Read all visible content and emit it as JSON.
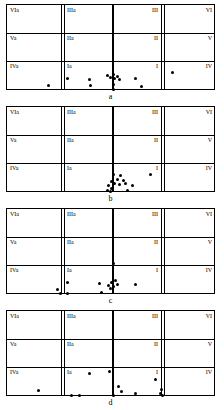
{
  "figure": {
    "title": "",
    "panel_letters": [
      "a",
      "b",
      "c",
      "d"
    ]
  },
  "grid": {
    "rows": 3,
    "columns": 4,
    "cell_labels": {
      "row_top": {
        "col1": "VIa",
        "col2": "IIIa",
        "col3": "III",
        "col4": "VI"
      },
      "row_middle": {
        "col1": "Va",
        "col2": "IIa",
        "col3": "II",
        "col4": "V"
      },
      "row_bottom": {
        "col1": "IVa",
        "col2": "Ia",
        "col3": "I",
        "col4": "IV"
      }
    }
  },
  "chart_data": {
    "type": "scatter",
    "title": "",
    "xlabel": "",
    "ylabel": "",
    "xlim": [
      0,
      209
    ],
    "ylim": [
      0,
      86
    ],
    "grid": true,
    "legend": "none",
    "axis_notes": {
      "vertical_center_line_x": 105,
      "row_boundaries_y": [
        28,
        56
      ],
      "column_boundaries_x": [
        54,
        105,
        154
      ]
    },
    "panels": [
      {
        "name": "a",
        "letter": "a",
        "points": [
          {
            "x": 41,
            "y": 80
          },
          {
            "x": 60,
            "y": 73
          },
          {
            "x": 82,
            "y": 74
          },
          {
            "x": 83,
            "y": 80
          },
          {
            "x": 100,
            "y": 70
          },
          {
            "x": 103,
            "y": 72
          },
          {
            "x": 106,
            "y": 69
          },
          {
            "x": 107,
            "y": 73
          },
          {
            "x": 110,
            "y": 71
          },
          {
            "x": 112,
            "y": 74
          },
          {
            "x": 106,
            "y": 79
          },
          {
            "x": 106,
            "y": 84
          },
          {
            "x": 128,
            "y": 73
          },
          {
            "x": 134,
            "y": 81
          },
          {
            "x": 165,
            "y": 67
          }
        ]
      },
      {
        "name": "b",
        "letter": "b",
        "points": [
          {
            "x": 106,
            "y": 67
          },
          {
            "x": 113,
            "y": 68
          },
          {
            "x": 110,
            "y": 72
          },
          {
            "x": 116,
            "y": 73
          },
          {
            "x": 104,
            "y": 74
          },
          {
            "x": 107,
            "y": 76
          },
          {
            "x": 112,
            "y": 77
          },
          {
            "x": 118,
            "y": 76
          },
          {
            "x": 101,
            "y": 78
          },
          {
            "x": 104,
            "y": 81
          },
          {
            "x": 100,
            "y": 83
          },
          {
            "x": 103,
            "y": 84
          },
          {
            "x": 125,
            "y": 78
          },
          {
            "x": 120,
            "y": 83
          },
          {
            "x": 143,
            "y": 67
          }
        ]
      },
      {
        "name": "c",
        "letter": "c",
        "points": [
          {
            "x": 106,
            "y": 54
          },
          {
            "x": 50,
            "y": 80
          },
          {
            "x": 53,
            "y": 84
          },
          {
            "x": 60,
            "y": 73
          },
          {
            "x": 60,
            "y": 84
          },
          {
            "x": 92,
            "y": 74
          },
          {
            "x": 94,
            "y": 83
          },
          {
            "x": 101,
            "y": 76
          },
          {
            "x": 103,
            "y": 79
          },
          {
            "x": 104,
            "y": 73
          },
          {
            "x": 106,
            "y": 77
          },
          {
            "x": 108,
            "y": 71
          },
          {
            "x": 110,
            "y": 75
          },
          {
            "x": 128,
            "y": 75
          }
        ]
      },
      {
        "name": "d",
        "letter": "d",
        "points": [
          {
            "x": 31,
            "y": 79
          },
          {
            "x": 64,
            "y": 84
          },
          {
            "x": 72,
            "y": 84
          },
          {
            "x": 82,
            "y": 62
          },
          {
            "x": 102,
            "y": 60
          },
          {
            "x": 106,
            "y": 84
          },
          {
            "x": 111,
            "y": 75
          },
          {
            "x": 114,
            "y": 80
          },
          {
            "x": 128,
            "y": 82
          },
          {
            "x": 148,
            "y": 68
          },
          {
            "x": 154,
            "y": 78
          },
          {
            "x": 153,
            "y": 82
          },
          {
            "x": 155,
            "y": 84
          }
        ]
      }
    ]
  }
}
